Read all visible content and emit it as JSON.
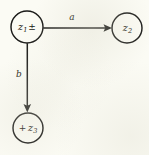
{
  "diagram": {
    "type": "directed-graph",
    "background_color": "#fbfbf4",
    "ink_color": "#1a1a18",
    "nodes": [
      {
        "id": "z1",
        "label": "z₁ ±",
        "symbol": "z",
        "subscript": "1",
        "annotation": "±",
        "annotation_position": "after",
        "cx": 27,
        "cy": 27,
        "r": 16
      },
      {
        "id": "z2",
        "label": "z₂",
        "symbol": "z",
        "subscript": "2",
        "annotation": "",
        "annotation_position": "none",
        "cx": 127,
        "cy": 28,
        "r": 15
      },
      {
        "id": "z3",
        "label": "+ z₃",
        "symbol": "z",
        "subscript": "3",
        "annotation": "+",
        "annotation_position": "before",
        "cx": 28,
        "cy": 128,
        "r": 15
      }
    ],
    "edges": [
      {
        "id": "edge-a",
        "label": "a",
        "from": "z1",
        "to": "z2",
        "direction": "horizontal-right",
        "label_x": 72,
        "label_y": 17
      },
      {
        "id": "edge-b",
        "label": "b",
        "from": "z1",
        "to": "z3",
        "direction": "vertical-down",
        "label_x": 19,
        "label_y": 74
      }
    ]
  }
}
